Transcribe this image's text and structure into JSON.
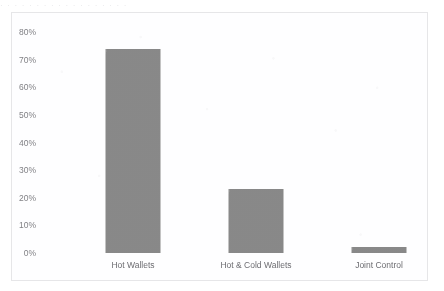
{
  "page": {
    "bleed_through_text": "·  ·    ·  ·  ·   ·   ·  ·    ·  ·   ·   ·  ·  ·     ·  ·   ·  ·"
  },
  "chart_data": {
    "type": "bar",
    "title": "",
    "subtitle": "",
    "xlabel": "",
    "ylabel": "",
    "categories": [
      "Hot Wallets",
      "Hot & Cold Wallets",
      "Joint Control"
    ],
    "values": [
      74,
      23,
      2
    ],
    "value_labels": [
      "74%",
      "23%",
      "2%"
    ],
    "ylim": [
      0,
      80
    ],
    "ytick_values": [
      0,
      10,
      20,
      30,
      40,
      50,
      60,
      70,
      80
    ],
    "ytick_labels": [
      "0%",
      "10%",
      "20%",
      "30%",
      "40%",
      "50%",
      "60%",
      "70%",
      "80%"
    ],
    "grid": false,
    "legend": "none",
    "series": [
      {
        "name": "Share of exchanges",
        "values": [
          74,
          23,
          2
        ],
        "color": "#8b8b8b"
      }
    ],
    "colors": {
      "bar_fill": "#8b8b8b",
      "axis_text": "#6f6f74",
      "category_text": "#5f5f64",
      "plot_border": "#e6e6e8",
      "background": "#fefeff"
    }
  }
}
